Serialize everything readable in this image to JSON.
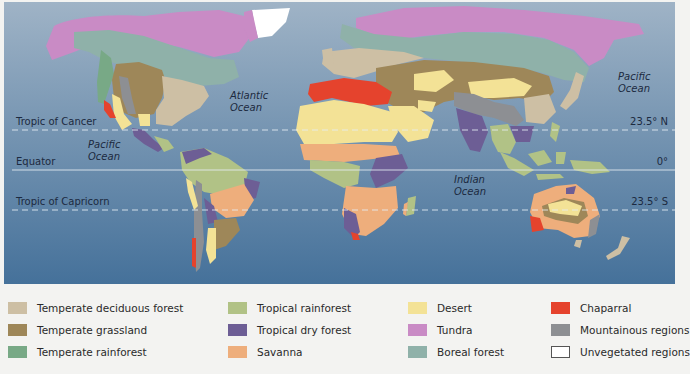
{
  "map": {
    "ocean_labels": [
      {
        "line1": "Atlantic",
        "line2": "Ocean"
      },
      {
        "line1": "Pacific",
        "line2": "Ocean"
      },
      {
        "line1": "Pacific",
        "line2": "Ocean"
      },
      {
        "line1": "Indian",
        "line2": "Ocean"
      }
    ],
    "latitude_lines": [
      {
        "name": "Tropic of Cancer",
        "value": "23.5° N"
      },
      {
        "name": "Equator",
        "value": "0°"
      },
      {
        "name": "Tropic of Capricorn",
        "value": "23.5° S"
      }
    ],
    "colors": {
      "ocean_top": "#9fb3c6",
      "ocean_bottom": "#45719a",
      "temperate_deciduous_forest": "#cdbfa4",
      "temperate_grassland": "#9e8759",
      "temperate_rainforest": "#78a986",
      "tropical_rainforest": "#b1c286",
      "tropical_dry_forest": "#6d5e95",
      "savanna": "#eeae7c",
      "desert": "#f3e296",
      "tundra": "#c98bc5",
      "boreal_forest": "#8fb1a9",
      "chaparral": "#e5432d",
      "mountainous_regions": "#8d8f93",
      "unvegetated_regions": "#ffffff"
    }
  },
  "legend": {
    "items": [
      {
        "label": "Temperate deciduous forest",
        "color": "#cdbfa4"
      },
      {
        "label": "Temperate grassland",
        "color": "#9e8759"
      },
      {
        "label": "Temperate rainforest",
        "color": "#78a986"
      },
      {
        "label": "Tropical rainforest",
        "color": "#b1c286"
      },
      {
        "label": "Tropical dry forest",
        "color": "#6d5e95"
      },
      {
        "label": "Savanna",
        "color": "#eeae7c"
      },
      {
        "label": "Desert",
        "color": "#f3e296"
      },
      {
        "label": "Tundra",
        "color": "#c98bc5"
      },
      {
        "label": "Boreal forest",
        "color": "#8fb1a9"
      },
      {
        "label": "Chaparral",
        "color": "#e5432d"
      },
      {
        "label": "Mountainous regions",
        "color": "#8d8f93"
      },
      {
        "label": "Unvegetated regions",
        "color": "#ffffff"
      }
    ]
  }
}
